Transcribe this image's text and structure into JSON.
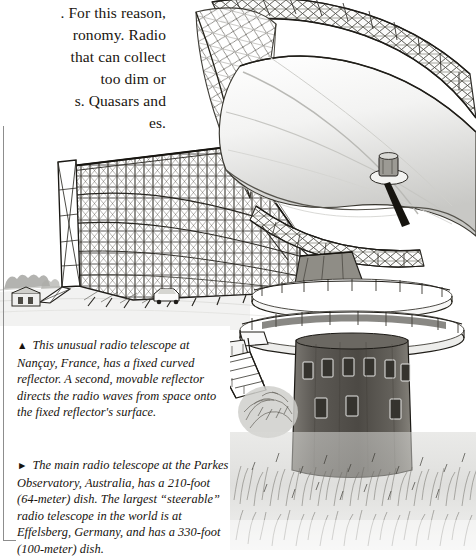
{
  "page": {
    "background_color": "#ffffff",
    "ink_color": "#15120f",
    "rule_color": "#8d8d8d"
  },
  "body_text": {
    "lines": [
      ". For this reason,",
      "ronomy. Radio",
      "that can collect",
      "too dim or",
      "s. Quasars and",
      "es."
    ]
  },
  "captions": [
    {
      "id": "caption-nancay",
      "marker": "▲",
      "marker_name": "triangle-up-marker",
      "text": "This unusual radio telescope at Nançay, France, has a fixed curved reflector. A second, movable reflector directs the radio waves from space onto the fixed reflector's surface."
    },
    {
      "id": "caption-parkes",
      "marker": "►",
      "marker_name": "triangle-right-marker",
      "text": "The main radio telescope at the Parkes Observatory, Australia, has a 210-foot (64-meter) dish. The largest “steerable” radio telescope in the world is at Effelsberg, Germany, and has a 330-foot (100-meter) dish."
    }
  ],
  "illustration": {
    "type": "pen-and-ink-drawing",
    "subjects": [
      {
        "name": "nancay-fixed-reflector",
        "description": "Tall fixed curved lattice reflector wall on open ground, Nançay France, with service hut and vehicle at its base"
      },
      {
        "name": "parkes-dish-telescope",
        "description": "Large steerable parabolic dish on a cylindrical concrete tower with two circular observation decks, external staircase and surrounding grass"
      }
    ]
  }
}
